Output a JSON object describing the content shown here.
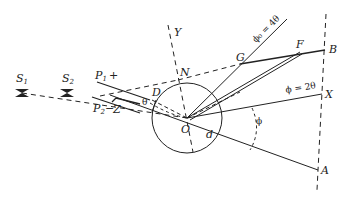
{
  "diagram": {
    "type": "geometric optics / scattering geometry",
    "points": {
      "S1": {
        "label": "S",
        "sub": "1"
      },
      "S2": {
        "label": "S",
        "sub": "2"
      },
      "P1": {
        "label": "P",
        "sub": "1",
        "sign": "+"
      },
      "P2": {
        "label": "P",
        "sub": "2",
        "sign": "−"
      },
      "Z": {
        "label": "Z"
      },
      "D": {
        "label": "D"
      },
      "N": {
        "label": "N"
      },
      "Y": {
        "label": "Y"
      },
      "G": {
        "label": "G"
      },
      "F": {
        "label": "F"
      },
      "B": {
        "label": "B"
      },
      "X": {
        "label": "X"
      },
      "A": {
        "label": "A"
      },
      "O": {
        "label": "O"
      },
      "d": {
        "label": "d"
      }
    },
    "angle_labels": {
      "theta": "θ",
      "phi": "ϕ",
      "phi0_line": "ϕ₀ = 4θ",
      "phi_line": "ϕ = 2θ"
    }
  }
}
